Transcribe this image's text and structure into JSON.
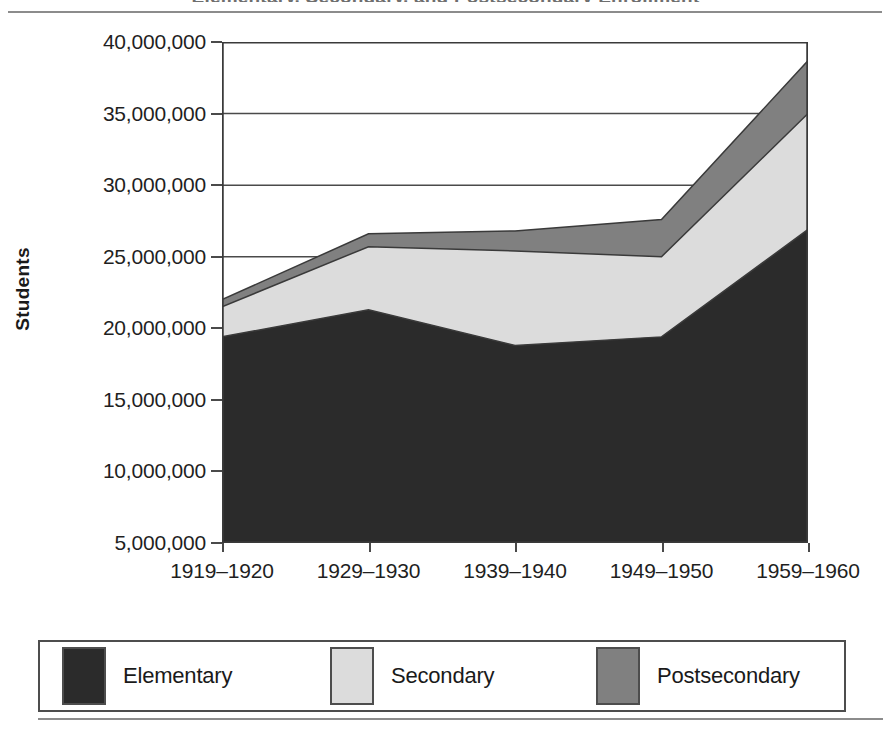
{
  "figure": {
    "cropped_title_remnant": "Elementary, Secondary, and Postsecondary Enrollment",
    "y_axis_title": "Students"
  },
  "legend": {
    "entries": [
      {
        "label": "Elementary",
        "color": "#2b2b2b"
      },
      {
        "label": "Secondary",
        "color": "#dcdcdc"
      },
      {
        "label": "Postsecondary",
        "color": "#808080"
      }
    ]
  },
  "chart_data": {
    "type": "area",
    "stacked": true,
    "title": "",
    "xlabel": "",
    "ylabel": "Students",
    "categories": [
      "1919–1920",
      "1929–1930",
      "1939–1940",
      "1949–1950",
      "1959–1960"
    ],
    "series": [
      {
        "name": "Elementary",
        "color": "#2b2b2b",
        "values": [
          19400000,
          21300000,
          18800000,
          19400000,
          26900000
        ]
      },
      {
        "name": "Secondary",
        "color": "#dcdcdc",
        "values": [
          2100000,
          4400000,
          6600000,
          5600000,
          8100000
        ]
      },
      {
        "name": "Postsecondary",
        "color": "#808080",
        "values": [
          500000,
          900000,
          1400000,
          2600000,
          3700000
        ]
      }
    ],
    "cumulative_tops": {
      "elementary": [
        19400000,
        21300000,
        18800000,
        19400000,
        26900000
      ],
      "secondary": [
        21500000,
        25700000,
        25400000,
        25000000,
        35000000
      ],
      "postsecondary": [
        22000000,
        26600000,
        26800000,
        27600000,
        38700000
      ]
    },
    "ylim": [
      5000000,
      40000000
    ],
    "ytick_labels": [
      "40,000,000",
      "35,000,000",
      "30,000,000",
      "25,000,000",
      "20,000,000",
      "15,000,000",
      "10,000,000",
      "5,000,000"
    ],
    "ytick_values": [
      40000000,
      35000000,
      30000000,
      25000000,
      20000000,
      15000000,
      10000000,
      5000000
    ],
    "grid": true,
    "legend_position": "bottom"
  }
}
